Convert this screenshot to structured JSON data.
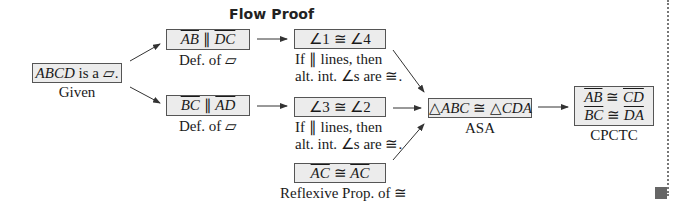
{
  "title": "Flow Proof",
  "nodes": {
    "given": {
      "statement_html": "ABCD is a ▱.",
      "reason": "Given"
    },
    "ab_par_dc": {
      "statement": "AB ∥ DC",
      "reason": "Def. of ▱"
    },
    "bc_par_ad": {
      "statement": "BC ∥ AD",
      "reason": "Def. of ▱"
    },
    "angle14": {
      "statement": "∠1 ≅ ∠4",
      "reason_line1": "If ∥ lines, then",
      "reason_line2": "alt. int. ∠s are ≅."
    },
    "angle32": {
      "statement": "∠3 ≅ ∠2",
      "reason_line1": "If ∥ lines, then",
      "reason_line2": "alt. int. ∠s are ≅."
    },
    "ac_ac": {
      "statement": "AC ≅ AC",
      "reason": "Reflexive Prop. of ≅"
    },
    "triangles": {
      "statement": "△ABC ≅ △CDA",
      "reason": "ASA"
    },
    "cpctc": {
      "line1": "AB ≅ CD",
      "line2": "BC ≅ DA",
      "reason": "CPCTC"
    }
  },
  "colors": {
    "box_fill": "#ececec",
    "box_border": "#555555",
    "arrow": "#333333",
    "end_marker": "#666666"
  }
}
